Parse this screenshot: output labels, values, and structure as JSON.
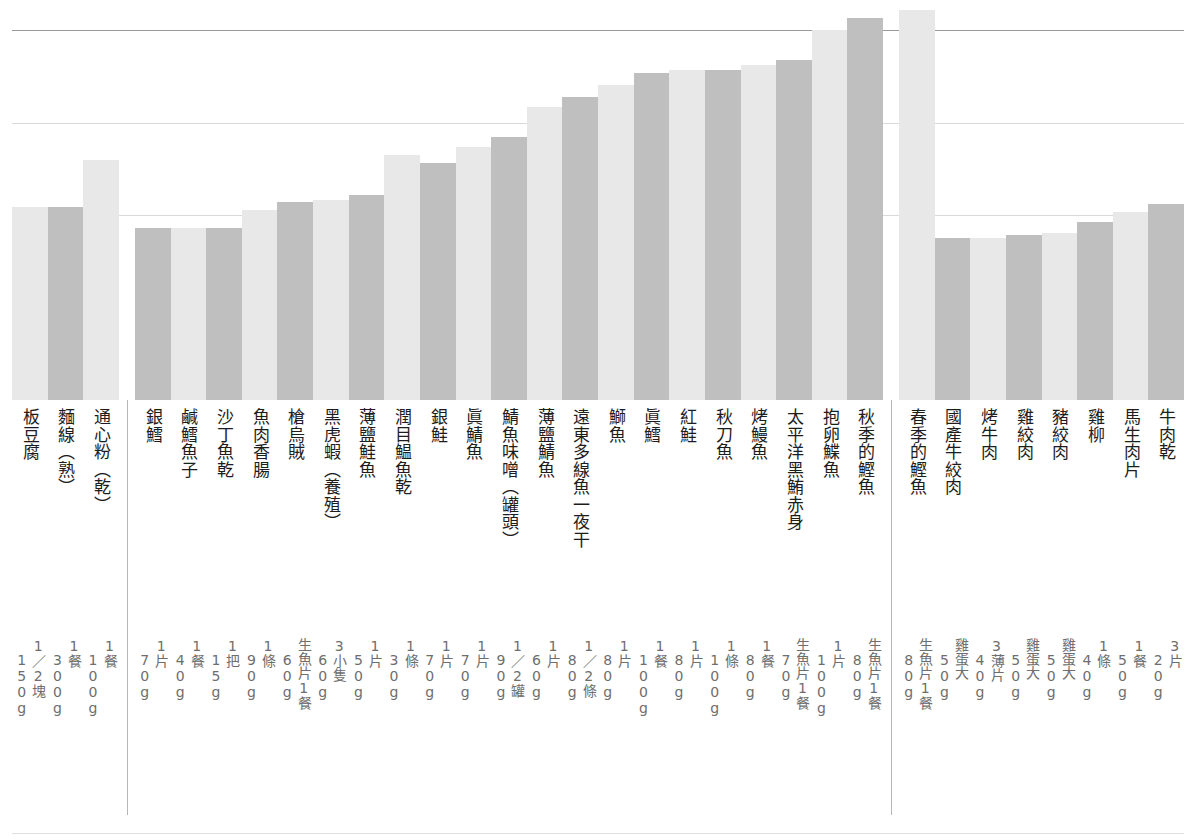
{
  "chart_data": {
    "type": "bar",
    "title": "",
    "xlabel": "",
    "ylabel": "",
    "ylim": [
      0,
      400
    ],
    "grid": true,
    "legend": "none",
    "gridlines_y_px": [
      30,
      123,
      215
    ],
    "axis_baseline_px": 400,
    "colors": {
      "bar_light": "#e8e8e8",
      "bar_dark": "#bfbfbf",
      "gridline": "#d9d9d9",
      "top_rule": "#9a9a9a",
      "separator": "#b6b6b6",
      "name_text": "#1d1d1d",
      "serving_text": "#6e6e6e"
    },
    "groups": [
      {
        "name": "staples",
        "start": 0,
        "count": 3
      },
      {
        "name": "seafood",
        "start": 3,
        "count": 21
      },
      {
        "name": "meat-egg",
        "start": 24,
        "count": 7
      }
    ],
    "categories": [
      "板豆腐",
      "麵線（熟）",
      "通心粉（乾）",
      "銀鱈",
      "鹹鱈魚子",
      "沙丁魚乾",
      "魚肉香腸",
      "槍烏賊",
      "黑虎蝦（養殖）",
      "薄鹽鮭魚",
      "潤目鰛魚乾",
      "銀鮭",
      "眞鯖魚",
      "鯖魚味噌（罐頭）",
      "薄鹽鯖魚",
      "遠東多線魚一夜干",
      "鰤魚",
      "眞鱈",
      "紅鮭",
      "秋刀魚",
      "烤鰻魚",
      "太平洋黑鮪赤身",
      "抱卵鰈魚",
      "秋季的鰹魚",
      "春季的鰹魚",
      "國產牛絞肉",
      "烤牛肉",
      "雞絞肉",
      "豬絞肉",
      "雞柳",
      "馬生肉片",
      "牛肉乾"
    ],
    "servings": [
      "1／2塊\n150g",
      "1餐\n300g",
      "1餐\n100g",
      "1片\n70g",
      "1餐\n40g",
      "1把\n15g",
      "1條\n90g",
      "生魚片1餐\n60g",
      "3小隻\n60g",
      "1片\n50g",
      "1條\n30g",
      "1片\n70g",
      "1片\n70g",
      "1／2罐\n90g",
      "1片\n60g",
      "1／2條\n80g",
      "1片\n80g",
      "1餐\n100g",
      "1片\n80g",
      "1條\n100g",
      "1餐\n80g",
      "生魚片1餐\n70g",
      "1片\n100g",
      "生魚片1餐\n80g",
      "生魚片1餐\n80g",
      "雞蛋大\n50g",
      "3薄片\n40g",
      "雞蛋大\n50g",
      "雞蛋大\n50g",
      "1條\n40g",
      "1餐\n50g",
      "3片\n20g"
    ],
    "values": [
      193,
      193,
      240,
      172,
      172,
      172,
      190,
      198,
      200,
      205,
      245,
      237,
      253,
      263,
      293,
      303,
      315,
      327,
      330,
      330,
      335,
      340,
      370,
      382,
      390,
      162,
      162,
      165,
      167,
      178,
      188,
      196
    ],
    "bar_tops_px": [
      207,
      207,
      160,
      228,
      228,
      228,
      210,
      202,
      200,
      195,
      155,
      163,
      147,
      137,
      107,
      97,
      85,
      73,
      70,
      70,
      65,
      60,
      30,
      18,
      10,
      238,
      238,
      235,
      233,
      222,
      212,
      204
    ],
    "bar_shades": [
      "light",
      "dark",
      "light",
      "dark",
      "light",
      "dark",
      "light",
      "dark",
      "light",
      "dark",
      "light",
      "dark",
      "light",
      "dark",
      "light",
      "dark",
      "light",
      "dark",
      "light",
      "dark",
      "light",
      "dark",
      "light",
      "dark",
      "light",
      "dark",
      "light",
      "dark",
      "light",
      "dark",
      "light",
      "dark"
    ]
  }
}
